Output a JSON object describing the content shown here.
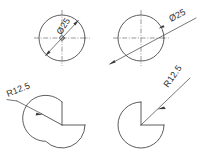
{
  "drawing": {
    "title": "Circle and partial-circle dimensioning examples",
    "background_color": "#ffffff",
    "line_color": "#4a4a4a",
    "text_color": "#2e2e2e",
    "figures": [
      {
        "id": "fig-top-left",
        "shape": "full-circle",
        "dimension_type": "diameter",
        "label": "Ø25",
        "value": 25,
        "symbol": "Ø",
        "arrow_style": "inside-double",
        "center": {
          "x": 62,
          "y": 38
        },
        "radius": 23,
        "label_rotation_deg": -58
      },
      {
        "id": "fig-top-right",
        "shape": "full-circle",
        "dimension_type": "diameter",
        "label": "Ø25",
        "value": 25,
        "symbol": "Ø",
        "arrow_style": "outside-leader",
        "center": {
          "x": 141,
          "y": 38
        },
        "radius": 23,
        "label_rotation_deg": -28
      },
      {
        "id": "fig-bottom-left",
        "shape": "circle-with-wedge-notch",
        "dimension_type": "radius",
        "label": "R12.5",
        "value": 12.5,
        "symbol": "R",
        "arrow_style": "outside-leader",
        "center": {
          "x": 62,
          "y": 125
        },
        "radius": 23,
        "notch_start_deg": 0,
        "notch_end_deg": 90,
        "label_rotation_deg": -28
      },
      {
        "id": "fig-bottom-right",
        "shape": "pac-man-quarter-removed",
        "dimension_type": "radius",
        "label": "R12.5",
        "value": 12.5,
        "symbol": "R",
        "arrow_style": "outside-leader",
        "center": {
          "x": 141,
          "y": 125
        },
        "radius": 23,
        "notch_start_deg": 0,
        "notch_end_deg": 90,
        "label_rotation_deg": -55
      }
    ],
    "labels": {
      "diameter_top_left": "Ø25",
      "diameter_top_right": "Ø25",
      "radius_bottom_left": "R12.5",
      "radius_bottom_right": "R12.5"
    }
  }
}
